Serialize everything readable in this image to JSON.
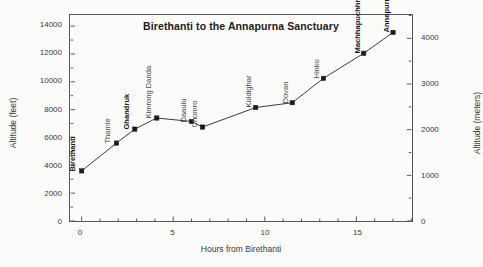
{
  "chart_data": {
    "type": "line",
    "title": "Birethanti to the Annapurna Sanctuary",
    "xlabel": "Hours from Birethanti",
    "ylabel": "Altitude (feet)",
    "ylabel_right": "Altitude (meters)",
    "xlim": [
      -0.6,
      18.0
    ],
    "ylim": [
      0,
      14800
    ],
    "ylim_right": [
      0,
      4511
    ],
    "grid": false,
    "legend": null,
    "xticks": [
      0,
      5,
      10,
      15
    ],
    "xtick_labels": [
      "0",
      "5",
      "10",
      "15"
    ],
    "xminor_step": 1,
    "yticks": [
      0,
      2000,
      4000,
      6000,
      8000,
      10000,
      12000,
      14000
    ],
    "ytick_labels": [
      "0",
      "2000",
      "4000",
      "6000",
      "8000",
      "10000",
      "12000",
      "14000"
    ],
    "yminor_step": 1000,
    "yticks_right": [
      0,
      1000,
      2000,
      3000,
      4000
    ],
    "ytick_labels_right": [
      "0",
      "1000",
      "2000",
      "3000",
      "4000"
    ],
    "yminor_step_right": 500,
    "marker": "square",
    "marker_color": "#1b1b1b",
    "line_color": "#3a3a3a",
    "x": [
      0.0,
      1.9,
      2.9,
      4.1,
      6.0,
      6.6,
      9.5,
      11.5,
      13.2,
      15.4,
      17.0
    ],
    "y": [
      3600,
      5600,
      6600,
      7400,
      7150,
      6750,
      8150,
      8500,
      10250,
      12050,
      13550
    ],
    "point_labels": [
      "Birethanti",
      "Thamle",
      "Ghandruk",
      "Kimrong Danda",
      "Daaulu",
      "Chomro",
      "Kuldighar",
      "Dovan",
      "Hinko",
      "Machhapuchhre Base Camp",
      "Annapurna Base Camp"
    ],
    "point_label_bold": [
      true,
      false,
      true,
      false,
      false,
      false,
      false,
      false,
      false,
      true,
      true
    ],
    "points": [
      {
        "name": "Birethanti",
        "hours": 0.0,
        "feet": 3600,
        "meters": 1097,
        "overnight": true
      },
      {
        "name": "Thamle",
        "hours": 1.9,
        "feet": 5600,
        "meters": 1707,
        "overnight": false
      },
      {
        "name": "Ghandruk",
        "hours": 2.9,
        "feet": 6600,
        "meters": 2012,
        "overnight": true
      },
      {
        "name": "Kimrong Danda",
        "hours": 4.1,
        "feet": 7400,
        "meters": 2256,
        "overnight": false
      },
      {
        "name": "Daaulu",
        "hours": 6.0,
        "feet": 7150,
        "meters": 2179,
        "overnight": false
      },
      {
        "name": "Chomro",
        "hours": 6.6,
        "feet": 6750,
        "meters": 2057,
        "overnight": false
      },
      {
        "name": "Kuldighar",
        "hours": 9.5,
        "feet": 8150,
        "meters": 2484,
        "overnight": false
      },
      {
        "name": "Dovan",
        "hours": 11.5,
        "feet": 8500,
        "meters": 2591,
        "overnight": false
      },
      {
        "name": "Hinko",
        "hours": 13.2,
        "feet": 10250,
        "meters": 3124,
        "overnight": false
      },
      {
        "name": "Machhapuchhre Base Camp",
        "hours": 15.4,
        "feet": 12050,
        "meters": 3673,
        "overnight": true
      },
      {
        "name": "Annapurna Base Camp",
        "hours": 17.0,
        "feet": 13550,
        "meters": 4130,
        "overnight": true
      }
    ]
  }
}
